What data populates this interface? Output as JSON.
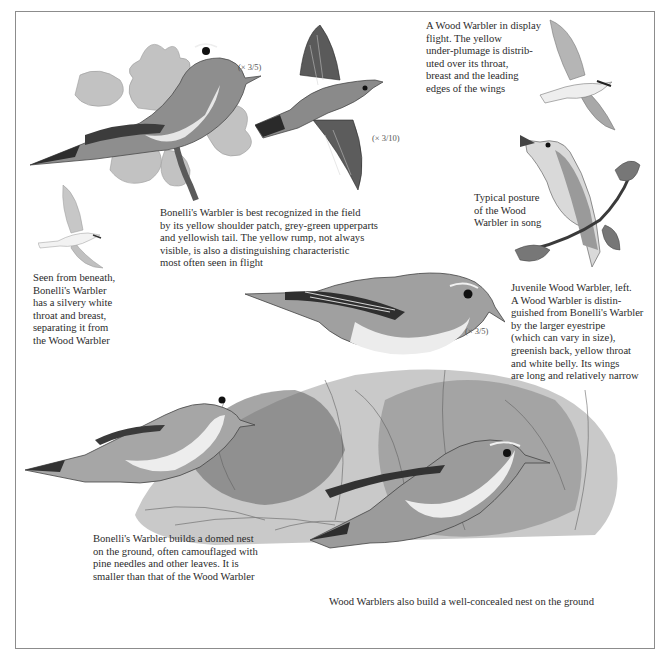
{
  "page": {
    "style": "grayscale scanned field-guide plate",
    "colors": {
      "background": "#ffffff",
      "border": "#8c8c8c",
      "text": "#2b2b2b",
      "ink_dark": "#1e1e1e",
      "feather_mid": "#8a8a8a",
      "feather_light": "#c8c8c8"
    }
  },
  "scales": {
    "perched_bonelli": "(× 3/5)",
    "flying_bonelli": "(× 3/10)",
    "perched_wood": "(× 3/5)"
  },
  "captions": {
    "display_flight": "A Wood Warbler in display\nflight. The yellow\nunder-plumage is distrib-\nuted over its throat,\nbreast and the leading\nedges of the wings",
    "bonelli_field": "Bonelli's Warbler is best recognized in the field\nby its yellow shoulder patch, grey-green upperparts\nand yellowish tail. The yellow rump, not always\nvisible, is also a distinguishing characteristic\nmost often seen in flight",
    "song_posture": "Typical posture\nof the Wood\nWarbler in song",
    "from_beneath": "Seen from beneath,\nBonelli's Warbler\nhas a silvery white\nthroat and breast,\nseparating it from\nthe Wood Warbler",
    "juvenile": "Juvenile Wood Warbler, left.\nA Wood Warbler is distin-\nguished from Bonelli's Warbler\nby the larger eyestripe\n(which can vary in size),\ngreenish back, yellow throat\nand white belly. Its wings\nare long and relatively narrow",
    "bonelli_nest": "Bonelli's Warbler builds a domed nest\non the ground, often camouflaged with\npine needles and other leaves. It is\nsmaller than that of the Wood Warbler",
    "wood_nest": "Wood Warblers also build a well-concealed nest on the ground"
  },
  "illustrations": [
    {
      "id": "bonelli-perched-oak",
      "label": "Bonelli's Warbler perched on oak branch"
    },
    {
      "id": "bonelli-flying-above",
      "label": "Bonelli's Warbler in flight, upper view"
    },
    {
      "id": "wood-display-flight",
      "label": "Wood Warbler display flight"
    },
    {
      "id": "wood-singing",
      "label": "Wood Warbler singing on twig"
    },
    {
      "id": "bonelli-from-beneath",
      "label": "Bonelli's Warbler seen from beneath"
    },
    {
      "id": "wood-perched-large",
      "label": "Wood Warbler perched on nest"
    },
    {
      "id": "bonelli-at-nest",
      "label": "Bonelli's Warbler at domed nest"
    },
    {
      "id": "wood-at-nest",
      "label": "Wood Warbler at ground nest"
    }
  ]
}
